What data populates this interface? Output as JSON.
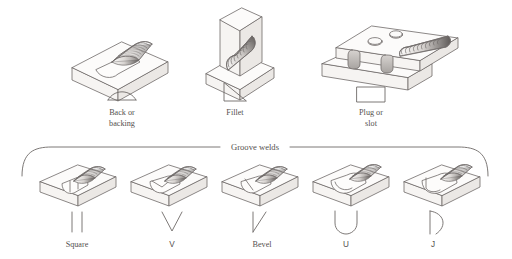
{
  "figure": {
    "line_color": "#6e6a68",
    "text_color": "#55514f",
    "background": "#ffffff",
    "bead_shade_light": "#f2f0ee",
    "bead_shade_dark": "#4f4b49",
    "face_top": "#fcfbfa",
    "face_front": "#f6f4f2",
    "face_side": "#ebe8e5"
  },
  "group_label": "Groove welds",
  "top_row": [
    {
      "id": "back-or-backing",
      "label_line1": "Back or",
      "label_line2": "backing",
      "symbol": "dome-arc",
      "joint": "butt-plate-with-convex-bead"
    },
    {
      "id": "fillet",
      "label_line1": "Fillet",
      "label_line2": "",
      "symbol": "right-triangle",
      "joint": "tee-joint-with-diagonal-bead"
    },
    {
      "id": "plug-or-slot",
      "label_line1": "Plug or",
      "label_line2": "slot",
      "symbol": "rectangle",
      "joint": "lap-joint-with-holes-and-slot-bead"
    }
  ],
  "groove_row": [
    {
      "id": "square",
      "label": "Square",
      "symbol": "two-parallel-vertical-lines",
      "joint": "square-groove-block"
    },
    {
      "id": "v",
      "label": "V",
      "symbol": "vee",
      "joint": "v-groove-block"
    },
    {
      "id": "bevel",
      "label": "Bevel",
      "symbol": "vertical-line-with-diagonal",
      "joint": "bevel-groove-block"
    },
    {
      "id": "u",
      "label": "U",
      "symbol": "u-shape",
      "joint": "u-groove-block"
    },
    {
      "id": "j",
      "label": "J",
      "symbol": "vertical-line-with-hook",
      "joint": "j-groove-block"
    }
  ]
}
